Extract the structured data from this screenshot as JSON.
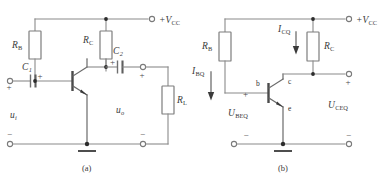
{
  "figure": {
    "captions": {
      "a": "(a)",
      "b": "(b)"
    }
  },
  "circuit_a": {
    "supply_label": "+V",
    "supply_sub": "CC",
    "resistors": [
      {
        "name": "R_B",
        "label": "R",
        "sub": "B"
      },
      {
        "name": "R_C",
        "label": "R",
        "sub": "C"
      },
      {
        "name": "R_L",
        "label": "R",
        "sub": "L"
      }
    ],
    "capacitors": [
      {
        "name": "C_1",
        "label": "C",
        "sub": "1",
        "polarity": "+"
      },
      {
        "name": "C_2",
        "label": "C",
        "sub": "2",
        "polarity": "+"
      }
    ],
    "input_source": {
      "label": "u",
      "sub": "i",
      "plus": "+",
      "minus": "−"
    },
    "output_source": {
      "label": "u",
      "sub": "o",
      "plus": "+",
      "minus": "−"
    },
    "transistor": {
      "type": "npn"
    },
    "ground": "ground-symbol"
  },
  "circuit_b": {
    "supply_label": "+V",
    "supply_sub": "CC",
    "resistors": [
      {
        "name": "R_B",
        "label": "R",
        "sub": "B"
      },
      {
        "name": "R_C",
        "label": "R",
        "sub": "C"
      }
    ],
    "currents": [
      {
        "name": "I_BQ",
        "label": "I",
        "sub": "BQ"
      },
      {
        "name": "I_CQ",
        "label": "I",
        "sub": "CQ"
      }
    ],
    "voltages": [
      {
        "name": "U_BEQ",
        "label": "U",
        "sub": "BEQ",
        "plus": "+",
        "minus": "−"
      },
      {
        "name": "U_CEQ",
        "label": "U",
        "sub": "CEQ",
        "plus": "+",
        "minus": "−"
      }
    ],
    "transistor": {
      "type": "npn",
      "pins": {
        "base": "b",
        "collector": "c",
        "emitter": "e"
      }
    },
    "ground": "ground-symbol"
  }
}
